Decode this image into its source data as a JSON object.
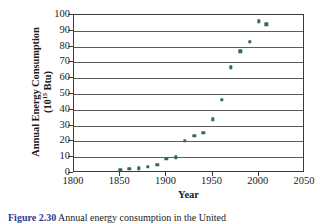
{
  "figure": {
    "caption_label": "Figure 2.30",
    "caption_text": "Annual energy consumption in the United"
  },
  "chart_data": {
    "type": "scatter",
    "title": "",
    "xlabel": "Year",
    "ylabel": "Annual Energy Consumption (10^15 Btu)",
    "ylabel_line1": "Annual Energy Consumption",
    "ylabel_line2_prefix": "(10",
    "ylabel_line2_sup": "15",
    "ylabel_line2_suffix": " Btu)",
    "xlim": [
      1800,
      2050
    ],
    "ylim": [
      0,
      100
    ],
    "xticks": [
      1800,
      1850,
      1900,
      1950,
      2000,
      2050
    ],
    "xtick_labels": [
      "1800",
      "1850",
      "1900",
      "1950",
      "2000",
      "2050"
    ],
    "yticks": [
      0,
      10,
      20,
      30,
      40,
      50,
      60,
      70,
      80,
      90,
      100
    ],
    "ytick_labels": [
      "0",
      "10",
      "20",
      "30",
      "40",
      "50",
      "60",
      "70",
      "80",
      "90",
      "100"
    ],
    "grid": "horizontal",
    "legend": "none",
    "marker_color": "#2e6b5e",
    "x": [
      1850,
      1860,
      1870,
      1880,
      1890,
      1900,
      1910,
      1920,
      1930,
      1940,
      1950,
      1960,
      1970,
      1980,
      1990,
      2000,
      2008
    ],
    "values": [
      2,
      2.5,
      3,
      4,
      5,
      9,
      10,
      20.5,
      23.5,
      25.5,
      34,
      46.5,
      67,
      77,
      83,
      96,
      94
    ],
    "points": [
      {
        "x": 1850,
        "y": 2
      },
      {
        "x": 1860,
        "y": 2.5
      },
      {
        "x": 1870,
        "y": 3
      },
      {
        "x": 1880,
        "y": 4
      },
      {
        "x": 1890,
        "y": 5
      },
      {
        "x": 1900,
        "y": 9
      },
      {
        "x": 1910,
        "y": 10
      },
      {
        "x": 1920,
        "y": 20.5
      },
      {
        "x": 1930,
        "y": 23.5
      },
      {
        "x": 1940,
        "y": 25.5
      },
      {
        "x": 1950,
        "y": 34
      },
      {
        "x": 1960,
        "y": 46.5
      },
      {
        "x": 1970,
        "y": 67
      },
      {
        "x": 1980,
        "y": 77
      },
      {
        "x": 1990,
        "y": 83
      },
      {
        "x": 2000,
        "y": 96
      },
      {
        "x": 2008,
        "y": 94
      }
    ]
  }
}
